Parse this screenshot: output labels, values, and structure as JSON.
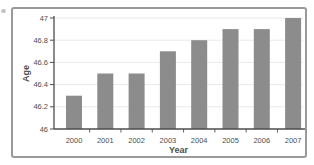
{
  "figure": {
    "background": "#ffffff",
    "frame_border_color": "#9a9a9a"
  },
  "chart_data": {
    "type": "bar",
    "title": "",
    "xlabel": "Year",
    "ylabel": "Age",
    "categories": [
      "2000",
      "2001",
      "2002",
      "2003",
      "2004",
      "2005",
      "2006",
      "2007"
    ],
    "values": [
      46.3,
      46.5,
      46.5,
      46.7,
      46.8,
      46.9,
      46.9,
      47.0
    ],
    "ylim": [
      46,
      47
    ],
    "yticks": [
      46,
      46.2,
      46.4,
      46.6,
      46.8,
      47
    ],
    "ytick_labels": [
      "46",
      "46.2",
      "46.4",
      "46.6",
      "46.8",
      "47"
    ],
    "grid": true,
    "legend": "none",
    "bar_color": "#8c8c8c",
    "axis_color": "#4d4d4d",
    "grid_color": "#e9e9e9",
    "text_color": "#4d4d4d"
  }
}
